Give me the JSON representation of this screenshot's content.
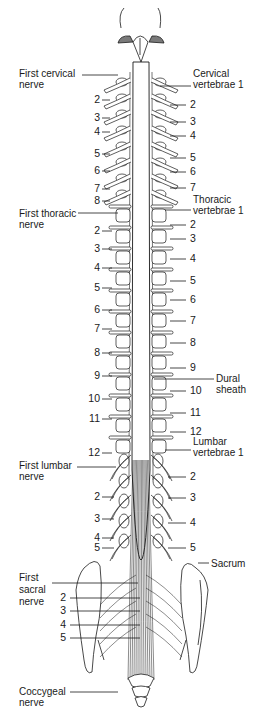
{
  "diagram": {
    "background": "#ffffff",
    "ink": "#1a1a1a",
    "shade": "#9a9a9a",
    "left_labels": {
      "first_cervical": [
        "First cervical",
        "nerve"
      ],
      "cervical_nums": [
        {
          "n": "2",
          "y": 94
        },
        {
          "n": "3",
          "y": 112
        },
        {
          "n": "4",
          "y": 126
        },
        {
          "n": "5",
          "y": 148
        },
        {
          "n": "6",
          "y": 165
        },
        {
          "n": "7",
          "y": 183
        },
        {
          "n": "8",
          "y": 195
        }
      ],
      "first_thoracic": [
        "First thoracic",
        "nerve"
      ],
      "thoracic_nums": [
        {
          "n": "2",
          "y": 225
        },
        {
          "n": "3",
          "y": 243
        },
        {
          "n": "4",
          "y": 262
        },
        {
          "n": "5",
          "y": 282
        },
        {
          "n": "6",
          "y": 304
        },
        {
          "n": "7",
          "y": 323
        },
        {
          "n": "8",
          "y": 347
        },
        {
          "n": "9",
          "y": 370
        },
        {
          "n": "10",
          "y": 393
        },
        {
          "n": "11",
          "y": 413
        },
        {
          "n": "12",
          "y": 447
        }
      ],
      "first_lumbar": [
        "First lumbar",
        "nerve"
      ],
      "lumbar_nums": [
        {
          "n": "2",
          "y": 491
        },
        {
          "n": "3",
          "y": 513
        },
        {
          "n": "4",
          "y": 532
        },
        {
          "n": "5",
          "y": 542
        }
      ],
      "first_sacral": [
        "First",
        "sacral",
        "nerve"
      ],
      "sacral_nums": [
        {
          "n": "2",
          "y": 592
        },
        {
          "n": "3",
          "y": 605
        },
        {
          "n": "4",
          "y": 619
        },
        {
          "n": "5",
          "y": 632
        }
      ],
      "coccygeal": [
        "Coccygeal",
        "nerve"
      ]
    },
    "right_labels": {
      "cervical_vertebrae": [
        "Cervical",
        "vertebrae 1"
      ],
      "cervical_nums": [
        {
          "n": "2",
          "y": 99
        },
        {
          "n": "3",
          "y": 116
        },
        {
          "n": "4",
          "y": 130
        },
        {
          "n": "5",
          "y": 152
        },
        {
          "n": "6",
          "y": 166
        },
        {
          "n": "7",
          "y": 182
        }
      ],
      "thoracic_vertebrae": [
        "Thoracic",
        "vertebrae 1"
      ],
      "thoracic_nums": [
        {
          "n": "2",
          "y": 219
        },
        {
          "n": "3",
          "y": 233
        },
        {
          "n": "4",
          "y": 253
        },
        {
          "n": "5",
          "y": 275
        },
        {
          "n": "6",
          "y": 294
        },
        {
          "n": "7",
          "y": 315
        },
        {
          "n": "8",
          "y": 337
        },
        {
          "n": "9",
          "y": 362
        },
        {
          "n": "10",
          "y": 385
        },
        {
          "n": "11",
          "y": 407
        },
        {
          "n": "12",
          "y": 426
        }
      ],
      "dural_sheath": [
        "Dural",
        "sheath"
      ],
      "lumbar_vertebrae": [
        "Lumbar",
        "vertebrae 1"
      ],
      "lumbar_nums": [
        {
          "n": "2",
          "y": 471
        },
        {
          "n": "3",
          "y": 492
        },
        {
          "n": "4",
          "y": 517
        },
        {
          "n": "5",
          "y": 542
        }
      ],
      "sacrum": "Sacrum",
      "artist_signature": "HARDY"
    }
  }
}
